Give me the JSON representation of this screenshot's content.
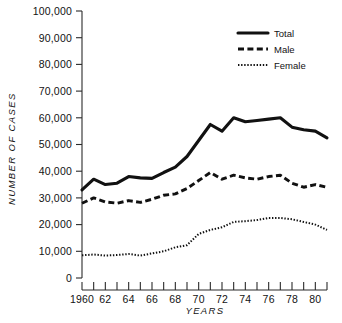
{
  "chart_data": {
    "type": "line",
    "title": "",
    "xlabel": "YEARS",
    "ylabel": "NUMBER OF CASES",
    "xlim": [
      1960,
      1981
    ],
    "ylim": [
      0,
      100000
    ],
    "grid": false,
    "legend_position": "upper-right",
    "x": [
      1960,
      1961,
      1962,
      1963,
      1964,
      1965,
      1966,
      1967,
      1968,
      1969,
      1970,
      1971,
      1972,
      1973,
      1974,
      1975,
      1976,
      1977,
      1978,
      1979,
      1980,
      1981
    ],
    "y_ticks": [
      0,
      10000,
      20000,
      30000,
      40000,
      50000,
      60000,
      70000,
      80000,
      90000,
      100000
    ],
    "y_tick_labels": [
      "0",
      "10,000",
      "20,000",
      "30,000",
      "40,000",
      "50,000",
      "60,000",
      "70,000",
      "80,000",
      "90,000",
      "100,000"
    ],
    "x_ticks": [
      1960,
      1961,
      1962,
      1963,
      1964,
      1965,
      1966,
      1967,
      1968,
      1969,
      1970,
      1971,
      1972,
      1973,
      1974,
      1975,
      1976,
      1977,
      1978,
      1979,
      1980,
      1981
    ],
    "x_tick_labels": [
      "1960",
      "",
      "62",
      "",
      "64",
      "",
      "66",
      "",
      "68",
      "",
      "70",
      "",
      "72",
      "",
      "74",
      "",
      "76",
      "",
      "78",
      "",
      "80",
      ""
    ],
    "series": [
      {
        "name": "Total",
        "style": "solid",
        "values": [
          33000,
          37000,
          35000,
          35500,
          38000,
          37500,
          37300,
          39500,
          41500,
          45500,
          51500,
          57500,
          55000,
          60000,
          58500,
          59000,
          59500,
          60000,
          56500,
          55500,
          55000,
          52500
        ]
      },
      {
        "name": "Male",
        "style": "dashed",
        "values": [
          28000,
          30000,
          28500,
          28000,
          29000,
          28300,
          29500,
          31000,
          31500,
          33500,
          36500,
          39500,
          37000,
          38500,
          37500,
          37000,
          38000,
          38500,
          35500,
          34000,
          35000,
          34000
        ]
      },
      {
        "name": "Female",
        "style": "dotted",
        "values": [
          8500,
          8800,
          8400,
          8600,
          9000,
          8400,
          9200,
          10000,
          11500,
          12300,
          16500,
          18000,
          19000,
          21000,
          21300,
          21700,
          22500,
          22500,
          22000,
          21000,
          20000,
          18000
        ]
      }
    ]
  },
  "legend": {
    "entries": [
      {
        "label": "Total"
      },
      {
        "label": "Male"
      },
      {
        "label": "Female"
      }
    ]
  }
}
